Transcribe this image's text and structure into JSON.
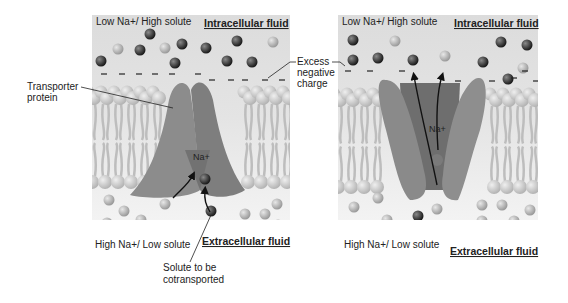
{
  "figure": {
    "panels": [
      {
        "id": "left",
        "top_label": "Low Na+/ High solute",
        "top_region": "Intracellular fluid",
        "bottom_label": "High Na+/ Low solute",
        "bottom_region": "Extracellular fluid",
        "ion_label": "Na+"
      },
      {
        "id": "right",
        "top_label": "Low Na+/ High solute",
        "top_region": "Intracellular fluid",
        "bottom_label": "High Na+/ Low solute",
        "bottom_region": "Extracellular fluid",
        "ion_label": "Na+"
      }
    ],
    "callouts": {
      "transporter_line1": "Transporter",
      "transporter_line2": "protein",
      "excess_line1": "Excess",
      "excess_line2": "negative",
      "excess_line3": "charge",
      "solute_line1": "Solute to be",
      "solute_line2": "cotransported"
    },
    "colors": {
      "fluid_bg": "#e6e6e6",
      "lipid_head": "#c8c8c8",
      "lipid_tail": "#bdbdbd",
      "protein": "#8a8a8a",
      "protein_dark": "#6f6f6f",
      "sodium_ion": "#b5b5b5",
      "solute": "#3a3a3a"
    }
  }
}
